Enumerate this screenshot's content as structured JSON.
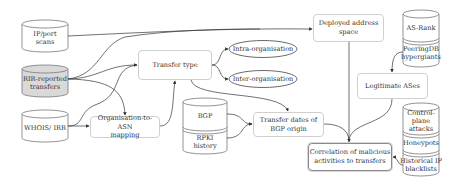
{
  "diagram": {
    "sources": {
      "ip_port_scans": {
        "label": "IP/port scans",
        "line1": "IP/port",
        "line2": "scans"
      },
      "rir_reported_transfers": {
        "label": "RIR-reported transfers",
        "line1": "RIR-reported",
        "line2": "transfers",
        "fill": "#d9d9d9"
      },
      "whois_irr": {
        "label": "WHOIS/ IRR"
      },
      "bgp_rpki": {
        "segments": [
          {
            "label": "BGP"
          },
          {
            "line1": "RPKI",
            "line2": "history"
          }
        ]
      },
      "as_rank_peeringdb": {
        "segments": [
          {
            "label": "AS-Rank"
          },
          {
            "line1": "PeeringDB",
            "line2": "hypergiants"
          }
        ]
      },
      "malicious_sources": {
        "segments": [
          {
            "line1": "Control-plane",
            "line2": "attacks"
          },
          {
            "label": "Honeypots"
          },
          {
            "line1": "Historical IP",
            "line2": "blacklists"
          }
        ]
      }
    },
    "processes": {
      "transfer_type": {
        "label": "Transfer type"
      },
      "org_to_asn": {
        "line1": "Organisation-to-ASN",
        "line2": "mapping"
      },
      "deployed_address_space": {
        "line1": "Deployed address",
        "line2": "space"
      },
      "transfer_dates": {
        "line1": "Transfer dates of",
        "line2": "BGP origin"
      },
      "legitimate_ases": {
        "label": "Legitimate ASes"
      },
      "correlation": {
        "line1": "Correlation of malicious",
        "line2": "activities to transfers"
      }
    },
    "outcomes": {
      "intra_org": {
        "label": "Intra-organisation"
      },
      "inter_org": {
        "label": "Inter-organisation"
      }
    },
    "colors": {
      "edge": "#333333",
      "node_border": "#cfcfcf",
      "main_border": "#8a8a8a",
      "cylinder_gray": "#d9d9d9"
    }
  }
}
